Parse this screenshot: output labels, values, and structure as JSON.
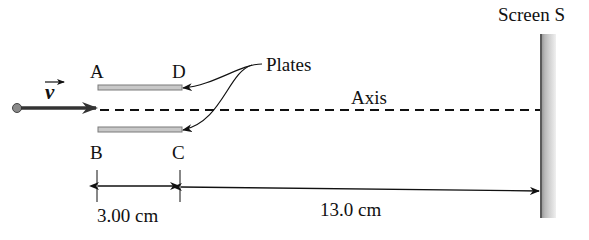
{
  "figure": {
    "labels": {
      "velocity": "v",
      "plate_a": "A",
      "plate_d": "D",
      "plate_b": "B",
      "plate_c": "C",
      "plates": "Plates",
      "axis": "Axis",
      "screen": "Screen S"
    },
    "dimensions": {
      "plate_length": "3.00 cm",
      "plate_to_screen": "13.0 cm"
    },
    "colors": {
      "ink": "#111111",
      "plate_fill": "#c8c8c8",
      "plate_edge": "#7a7a7a",
      "screen_edge": "#5a5a5a"
    }
  }
}
